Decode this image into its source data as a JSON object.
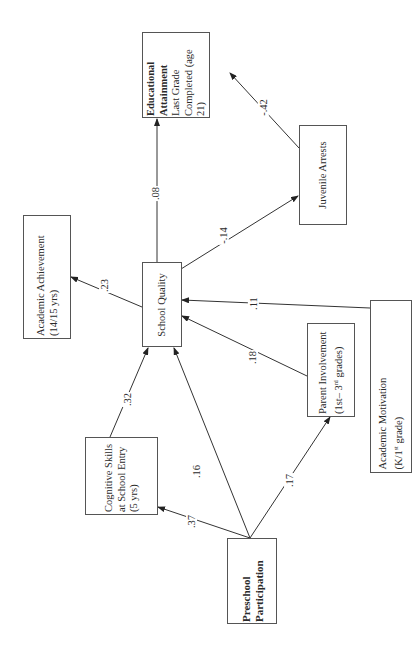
{
  "diagram": {
    "type": "path-model",
    "orientation": "rotated-90-ccw",
    "nodes": {
      "educational_attainment": {
        "title": "Educational Attainment",
        "subtitle": "Last Grade Completed (age 21)"
      },
      "juvenile_arrests": {
        "title": "Juvenile Arrests"
      },
      "academic_achievement": {
        "title": "Academic Achievement (14/15 yrs)"
      },
      "school_quality": {
        "title": "School Quality"
      },
      "cognitive_skills": {
        "title": "Cognitive Skills at School Entry (5 yrs)"
      },
      "parent_involvement": {
        "title": "Parent Involvement (1st–",
        "title_sup": "rd",
        "title_tail_pre": "3",
        "title_tail": " grades)"
      },
      "academic_motivation": {
        "title": "Academic Motivation",
        "line2_pre": "(K/1",
        "line2_sup": "st",
        "line2_post": " grade)"
      },
      "preschool_participation": {
        "title": "Preschool Participation"
      }
    },
    "edges": [
      {
        "from": "school_quality",
        "to": "educational_attainment",
        "coef": ".08"
      },
      {
        "from": "juvenile_arrests",
        "to": "educational_attainment",
        "coef": "-.42"
      },
      {
        "from": "school_quality",
        "to": "juvenile_arrests",
        "coef": "-.14"
      },
      {
        "from": "school_quality",
        "to": "academic_achievement",
        "coef": ".23"
      },
      {
        "from": "cognitive_skills",
        "to": "school_quality",
        "coef": ".32"
      },
      {
        "from": "academic_motivation",
        "to": "school_quality",
        "coef": ".11"
      },
      {
        "from": "parent_involvement",
        "to": "school_quality",
        "coef": ".18"
      },
      {
        "from": "preschool_participation",
        "to": "school_quality",
        "coef": ".16"
      },
      {
        "from": "preschool_participation",
        "to": "cognitive_skills",
        "coef": ".37"
      },
      {
        "from": "preschool_participation",
        "to": "parent_involvement",
        "coef": ".17"
      }
    ]
  }
}
